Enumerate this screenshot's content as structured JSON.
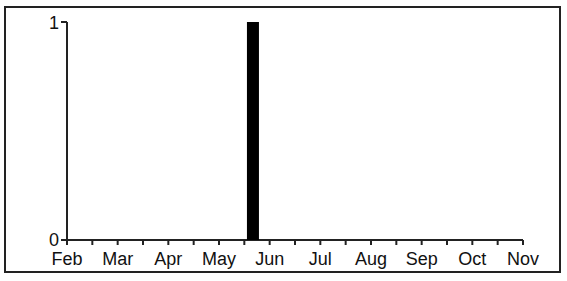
{
  "chart_data": {
    "type": "bar",
    "title": "",
    "xlabel": "",
    "ylabel": "",
    "x_tick_labels": [
      "Feb",
      "Mar",
      "Apr",
      "May",
      "Jun",
      "Jul",
      "Aug",
      "Sep",
      "Oct",
      "Nov"
    ],
    "y_tick_labels": [
      "0",
      "1"
    ],
    "ylim": [
      0,
      1
    ],
    "xlim": [
      "Feb",
      "Nov"
    ],
    "grid": false,
    "legend": null,
    "series": [
      {
        "name": "events",
        "color": "#000000",
        "points": [
          {
            "x": "late Apr",
            "x_month_fraction": 3.67,
            "y": 1
          }
        ]
      }
    ],
    "minor_ticks": "half-month"
  },
  "colors": {
    "bar": "#000000",
    "axis": "#222222",
    "background": "#ffffff"
  }
}
